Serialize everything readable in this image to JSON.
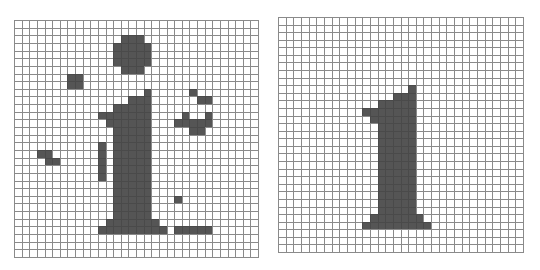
{
  "figure": {
    "fill_color": "#555555",
    "grid_line_color": "#8a8a8a",
    "cols": 32,
    "rows": 31,
    "panels": [
      {
        "id": "noisy",
        "label": "noisy-digit-grid",
        "x": 14,
        "y": 20,
        "width": 245,
        "height": 238,
        "cells": [
          [
            2,
            14
          ],
          [
            2,
            15
          ],
          [
            2,
            16
          ],
          [
            3,
            13
          ],
          [
            3,
            14
          ],
          [
            3,
            15
          ],
          [
            3,
            16
          ],
          [
            3,
            17
          ],
          [
            4,
            13
          ],
          [
            4,
            14
          ],
          [
            4,
            15
          ],
          [
            4,
            16
          ],
          [
            4,
            17
          ],
          [
            5,
            13
          ],
          [
            5,
            14
          ],
          [
            5,
            15
          ],
          [
            5,
            16
          ],
          [
            5,
            17
          ],
          [
            6,
            14
          ],
          [
            6,
            15
          ],
          [
            6,
            16
          ],
          [
            7,
            7
          ],
          [
            7,
            8
          ],
          [
            8,
            7
          ],
          [
            8,
            8
          ],
          [
            9,
            17
          ],
          [
            9,
            23
          ],
          [
            10,
            15
          ],
          [
            10,
            16
          ],
          [
            10,
            17
          ],
          [
            10,
            24
          ],
          [
            10,
            25
          ],
          [
            11,
            13
          ],
          [
            11,
            14
          ],
          [
            11,
            15
          ],
          [
            11,
            16
          ],
          [
            11,
            17
          ],
          [
            12,
            11
          ],
          [
            12,
            12
          ],
          [
            12,
            13
          ],
          [
            12,
            14
          ],
          [
            12,
            15
          ],
          [
            12,
            16
          ],
          [
            12,
            17
          ],
          [
            12,
            22
          ],
          [
            12,
            25
          ],
          [
            13,
            12
          ],
          [
            13,
            13
          ],
          [
            13,
            14
          ],
          [
            13,
            15
          ],
          [
            13,
            16
          ],
          [
            13,
            17
          ],
          [
            13,
            21
          ],
          [
            13,
            22
          ],
          [
            13,
            23
          ],
          [
            13,
            24
          ],
          [
            13,
            25
          ],
          [
            14,
            13
          ],
          [
            14,
            14
          ],
          [
            14,
            15
          ],
          [
            14,
            16
          ],
          [
            14,
            17
          ],
          [
            14,
            23
          ],
          [
            14,
            24
          ],
          [
            15,
            13
          ],
          [
            15,
            14
          ],
          [
            15,
            15
          ],
          [
            15,
            16
          ],
          [
            15,
            17
          ],
          [
            16,
            11
          ],
          [
            16,
            13
          ],
          [
            16,
            14
          ],
          [
            16,
            15
          ],
          [
            16,
            16
          ],
          [
            16,
            17
          ],
          [
            17,
            3
          ],
          [
            17,
            4
          ],
          [
            17,
            11
          ],
          [
            17,
            13
          ],
          [
            17,
            14
          ],
          [
            17,
            15
          ],
          [
            17,
            16
          ],
          [
            17,
            17
          ],
          [
            18,
            4
          ],
          [
            18,
            5
          ],
          [
            18,
            11
          ],
          [
            18,
            13
          ],
          [
            18,
            14
          ],
          [
            18,
            15
          ],
          [
            18,
            16
          ],
          [
            18,
            17
          ],
          [
            19,
            11
          ],
          [
            19,
            13
          ],
          [
            19,
            14
          ],
          [
            19,
            15
          ],
          [
            19,
            16
          ],
          [
            19,
            17
          ],
          [
            20,
            11
          ],
          [
            20,
            13
          ],
          [
            20,
            14
          ],
          [
            20,
            15
          ],
          [
            20,
            16
          ],
          [
            20,
            17
          ],
          [
            21,
            13
          ],
          [
            21,
            14
          ],
          [
            21,
            15
          ],
          [
            21,
            16
          ],
          [
            21,
            17
          ],
          [
            22,
            13
          ],
          [
            22,
            14
          ],
          [
            22,
            15
          ],
          [
            22,
            16
          ],
          [
            22,
            17
          ],
          [
            23,
            13
          ],
          [
            23,
            14
          ],
          [
            23,
            15
          ],
          [
            23,
            16
          ],
          [
            23,
            17
          ],
          [
            23,
            21
          ],
          [
            24,
            13
          ],
          [
            24,
            14
          ],
          [
            24,
            15
          ],
          [
            24,
            16
          ],
          [
            24,
            17
          ],
          [
            25,
            13
          ],
          [
            25,
            14
          ],
          [
            25,
            15
          ],
          [
            25,
            16
          ],
          [
            25,
            17
          ],
          [
            26,
            12
          ],
          [
            26,
            13
          ],
          [
            26,
            14
          ],
          [
            26,
            15
          ],
          [
            26,
            16
          ],
          [
            26,
            17
          ],
          [
            26,
            18
          ],
          [
            27,
            11
          ],
          [
            27,
            12
          ],
          [
            27,
            13
          ],
          [
            27,
            14
          ],
          [
            27,
            15
          ],
          [
            27,
            16
          ],
          [
            27,
            17
          ],
          [
            27,
            18
          ],
          [
            27,
            19
          ],
          [
            27,
            21
          ],
          [
            27,
            22
          ],
          [
            27,
            23
          ],
          [
            27,
            24
          ],
          [
            27,
            25
          ]
        ]
      },
      {
        "id": "clean",
        "label": "clean-digit-grid",
        "x": 278,
        "y": 17,
        "width": 246,
        "height": 236,
        "cells": [
          [
            9,
            17
          ],
          [
            10,
            15
          ],
          [
            10,
            16
          ],
          [
            10,
            17
          ],
          [
            11,
            13
          ],
          [
            11,
            14
          ],
          [
            11,
            15
          ],
          [
            11,
            16
          ],
          [
            11,
            17
          ],
          [
            12,
            11
          ],
          [
            12,
            12
          ],
          [
            12,
            13
          ],
          [
            12,
            14
          ],
          [
            12,
            15
          ],
          [
            12,
            16
          ],
          [
            12,
            17
          ],
          [
            13,
            12
          ],
          [
            13,
            13
          ],
          [
            13,
            14
          ],
          [
            13,
            15
          ],
          [
            13,
            16
          ],
          [
            13,
            17
          ],
          [
            14,
            13
          ],
          [
            14,
            14
          ],
          [
            14,
            15
          ],
          [
            14,
            16
          ],
          [
            14,
            17
          ],
          [
            15,
            13
          ],
          [
            15,
            14
          ],
          [
            15,
            15
          ],
          [
            15,
            16
          ],
          [
            15,
            17
          ],
          [
            16,
            13
          ],
          [
            16,
            14
          ],
          [
            16,
            15
          ],
          [
            16,
            16
          ],
          [
            16,
            17
          ],
          [
            17,
            13
          ],
          [
            17,
            14
          ],
          [
            17,
            15
          ],
          [
            17,
            16
          ],
          [
            17,
            17
          ],
          [
            18,
            13
          ],
          [
            18,
            14
          ],
          [
            18,
            15
          ],
          [
            18,
            16
          ],
          [
            18,
            17
          ],
          [
            19,
            13
          ],
          [
            19,
            14
          ],
          [
            19,
            15
          ],
          [
            19,
            16
          ],
          [
            19,
            17
          ],
          [
            20,
            13
          ],
          [
            20,
            14
          ],
          [
            20,
            15
          ],
          [
            20,
            16
          ],
          [
            20,
            17
          ],
          [
            21,
            13
          ],
          [
            21,
            14
          ],
          [
            21,
            15
          ],
          [
            21,
            16
          ],
          [
            21,
            17
          ],
          [
            22,
            13
          ],
          [
            22,
            14
          ],
          [
            22,
            15
          ],
          [
            22,
            16
          ],
          [
            22,
            17
          ],
          [
            23,
            13
          ],
          [
            23,
            14
          ],
          [
            23,
            15
          ],
          [
            23,
            16
          ],
          [
            23,
            17
          ],
          [
            24,
            13
          ],
          [
            24,
            14
          ],
          [
            24,
            15
          ],
          [
            24,
            16
          ],
          [
            24,
            17
          ],
          [
            25,
            13
          ],
          [
            25,
            14
          ],
          [
            25,
            15
          ],
          [
            25,
            16
          ],
          [
            25,
            17
          ],
          [
            26,
            12
          ],
          [
            26,
            13
          ],
          [
            26,
            14
          ],
          [
            26,
            15
          ],
          [
            26,
            16
          ],
          [
            26,
            17
          ],
          [
            26,
            18
          ],
          [
            27,
            11
          ],
          [
            27,
            12
          ],
          [
            27,
            13
          ],
          [
            27,
            14
          ],
          [
            27,
            15
          ],
          [
            27,
            16
          ],
          [
            27,
            17
          ],
          [
            27,
            18
          ],
          [
            27,
            19
          ]
        ]
      }
    ]
  }
}
